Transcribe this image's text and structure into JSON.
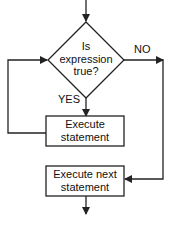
{
  "diagram": {
    "type": "flowchart",
    "decision": {
      "line1": "Is",
      "line2": "expression",
      "line3": "true?"
    },
    "yes_label": "YES",
    "no_label": "NO",
    "process_loop": {
      "line1": "Execute",
      "line2": "statement"
    },
    "process_next": {
      "line1": "Execute next",
      "line2": "statement"
    },
    "colors": {
      "stroke": "#222222",
      "background": "#ffffff",
      "text": "#111111"
    }
  }
}
